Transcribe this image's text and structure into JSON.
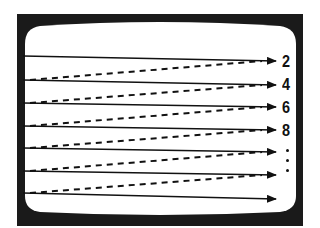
{
  "diagram": {
    "colors": {
      "frame": "#1a1a1a",
      "screen": "#ffffff",
      "lines": "#111111"
    },
    "scan_lines": [
      {
        "type": "solid",
        "x1": 23,
        "y1": 56,
        "x2": 276,
        "y2": 61
      },
      {
        "type": "solid",
        "x1": 23,
        "y1": 80,
        "x2": 276,
        "y2": 85
      },
      {
        "type": "solid",
        "x1": 23,
        "y1": 103,
        "x2": 276,
        "y2": 107
      },
      {
        "type": "solid",
        "x1": 23,
        "y1": 126,
        "x2": 276,
        "y2": 130
      },
      {
        "type": "solid",
        "x1": 23,
        "y1": 148,
        "x2": 276,
        "y2": 152
      },
      {
        "type": "solid",
        "x1": 23,
        "y1": 171,
        "x2": 276,
        "y2": 175
      },
      {
        "type": "solid",
        "x1": 23,
        "y1": 193,
        "x2": 276,
        "y2": 199
      }
    ],
    "retrace_lines": [
      {
        "type": "dashed",
        "x1": 30,
        "y1": 80,
        "x2": 262,
        "y2": 61
      },
      {
        "type": "dashed",
        "x1": 30,
        "y1": 103,
        "x2": 262,
        "y2": 85
      },
      {
        "type": "dashed",
        "x1": 30,
        "y1": 126,
        "x2": 262,
        "y2": 107
      },
      {
        "type": "dashed",
        "x1": 30,
        "y1": 148,
        "x2": 262,
        "y2": 130
      },
      {
        "type": "dashed",
        "x1": 30,
        "y1": 171,
        "x2": 262,
        "y2": 152
      },
      {
        "type": "dashed",
        "x1": 30,
        "y1": 193,
        "x2": 262,
        "y2": 175
      }
    ],
    "labels": [
      {
        "text": "2",
        "x": 282,
        "y": 53
      },
      {
        "text": "4",
        "x": 282,
        "y": 76
      },
      {
        "text": "6",
        "x": 282,
        "y": 99
      },
      {
        "text": "8",
        "x": 282,
        "y": 122
      }
    ],
    "ellipsis_dots": [
      {
        "x": 287,
        "y": 150
      },
      {
        "x": 287,
        "y": 160
      },
      {
        "x": 287,
        "y": 170
      }
    ]
  }
}
